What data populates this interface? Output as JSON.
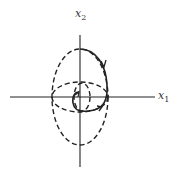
{
  "diagram": {
    "type": "phase-plane",
    "axes": {
      "x_label": "x",
      "x_sub": "1",
      "y_label": "x",
      "y_sub": "2"
    },
    "colors": {
      "ink": "#222222",
      "background": "#ffffff"
    },
    "curves": [
      {
        "name": "outer-vertical-ellipse",
        "style": "dashed"
      },
      {
        "name": "horizontal-ellipse",
        "style": "dashed"
      },
      {
        "name": "inner-small-ellipse",
        "style": "dashed"
      },
      {
        "name": "trajectory",
        "style": "solid",
        "direction": "clockwise spiral inward"
      }
    ]
  }
}
